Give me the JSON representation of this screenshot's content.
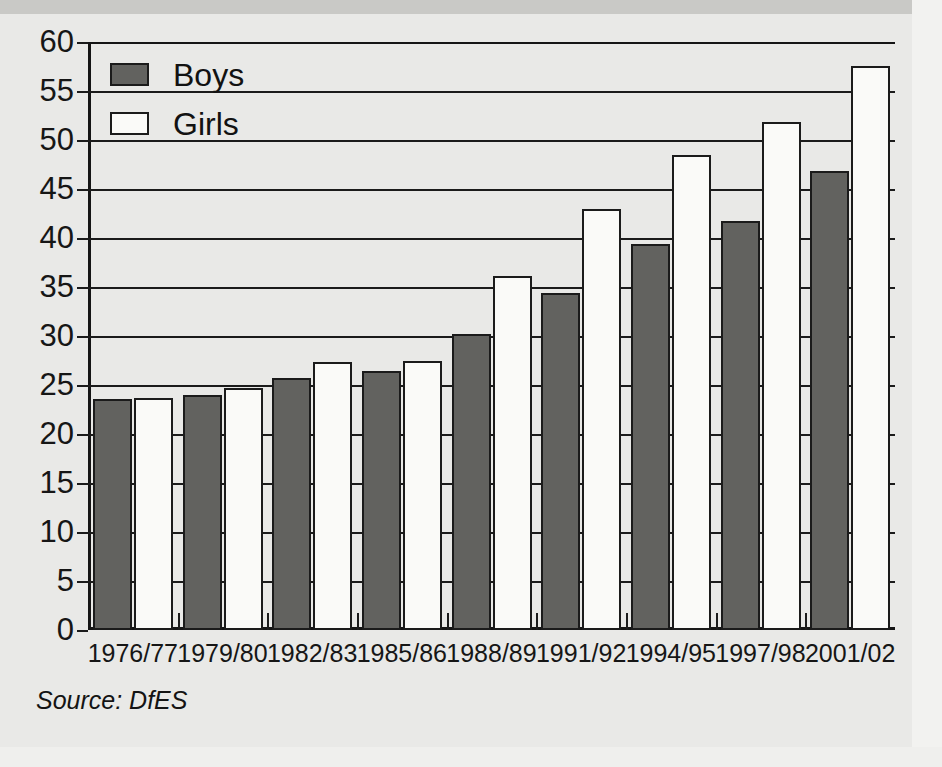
{
  "legend": {
    "items": [
      {
        "label": "Boys",
        "color": "#62625f",
        "swatch": "boys-swatch"
      },
      {
        "label": "Girls",
        "color": "#fafaf8",
        "swatch": "girls-swatch"
      }
    ]
  },
  "source": {
    "text": "Source: DfES"
  },
  "chart_data": {
    "type": "bar",
    "title": "",
    "subtitle": "",
    "xlabel": "",
    "ylabel": "",
    "grid": true,
    "legend_position": "top-left",
    "ylim": [
      0,
      60
    ],
    "ytick_step": 5,
    "yticks": [
      0,
      5,
      10,
      15,
      20,
      25,
      30,
      35,
      40,
      45,
      50,
      55,
      60
    ],
    "ytick_labels": [
      "0",
      "5",
      "10",
      "15",
      "20",
      "25",
      "30",
      "35",
      "40",
      "45",
      "50",
      "55",
      "60"
    ],
    "categories": [
      "1976/77",
      "1979/80",
      "1982/83",
      "1985/86",
      "1988/89",
      "1991/92",
      "1994/95",
      "1997/98",
      "2001/02"
    ],
    "series": [
      {
        "name": "Boys",
        "color": "#62625f",
        "values": [
          23.6,
          24.0,
          25.7,
          26.4,
          30.2,
          34.4,
          39.4,
          41.7,
          46.8
        ]
      },
      {
        "name": "Girls",
        "color": "#fafaf8",
        "values": [
          23.7,
          24.7,
          27.3,
          27.5,
          36.1,
          43.0,
          48.5,
          51.8,
          57.6
        ]
      }
    ],
    "annotations": [
      "Source: DfES"
    ]
  }
}
